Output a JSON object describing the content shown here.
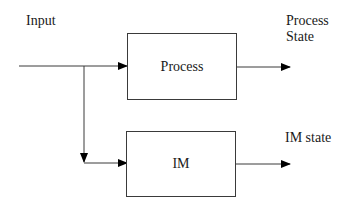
{
  "diagram": {
    "input_label": "Input",
    "blocks": [
      {
        "id": "process",
        "label": "Process"
      },
      {
        "id": "im",
        "label": "IM"
      }
    ],
    "outputs": [
      {
        "label_line1": "Process",
        "label_line2": "State"
      },
      {
        "label_line1": "IM state"
      }
    ],
    "colors": {
      "line": "#3a3a3a",
      "arrow": "#000000",
      "text": "#1a1a1a",
      "background": "#ffffff"
    }
  }
}
